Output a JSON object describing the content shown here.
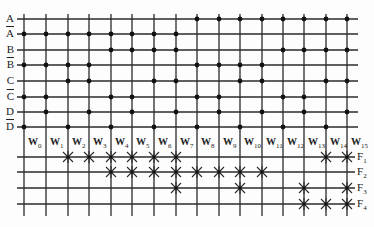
{
  "diagram": {
    "type": "PLA / decoder-based ROM crosspoint array",
    "colors": {
      "line": "#2a2a2a",
      "dot": "#111111",
      "background": "#fdfdfd"
    },
    "inputs": [
      {
        "name": "A",
        "complement": false,
        "y": 19
      },
      {
        "name": "A",
        "complement": true,
        "y": 34
      },
      {
        "name": "B",
        "complement": false,
        "y": 50
      },
      {
        "name": "B",
        "complement": true,
        "y": 65
      },
      {
        "name": "C",
        "complement": false,
        "y": 81
      },
      {
        "name": "C",
        "complement": true,
        "y": 97
      },
      {
        "name": "D",
        "complement": false,
        "y": 112
      },
      {
        "name": "D",
        "complement": true,
        "y": 127
      }
    ],
    "word_lines": [
      {
        "label": "W",
        "sub": "0",
        "x": 24,
        "bits": "0000"
      },
      {
        "label": "W",
        "sub": "1",
        "x": 46,
        "bits": "0001"
      },
      {
        "label": "W",
        "sub": "2",
        "x": 68,
        "bits": "0010"
      },
      {
        "label": "W",
        "sub": "3",
        "x": 89,
        "bits": "0011"
      },
      {
        "label": "W",
        "sub": "4",
        "x": 111,
        "bits": "0100"
      },
      {
        "label": "W",
        "sub": "5",
        "x": 132,
        "bits": "0101"
      },
      {
        "label": "W",
        "sub": "6",
        "x": 154,
        "bits": "0110"
      },
      {
        "label": "W",
        "sub": "7",
        "x": 176,
        "bits": "0111"
      },
      {
        "label": "W",
        "sub": "8",
        "x": 197,
        "bits": "1000"
      },
      {
        "label": "W",
        "sub": "9",
        "x": 219,
        "bits": "1001"
      },
      {
        "label": "W",
        "sub": "10",
        "x": 240,
        "bits": "1010"
      },
      {
        "label": "W",
        "sub": "11",
        "x": 262,
        "bits": "1011"
      },
      {
        "label": "W",
        "sub": "12",
        "x": 283,
        "bits": "1100"
      },
      {
        "label": "W",
        "sub": "13",
        "x": 304,
        "bits": "1101"
      },
      {
        "label": "W",
        "sub": "14",
        "x": 326,
        "bits": "1110"
      },
      {
        "label": "W",
        "sub": "15",
        "x": 347,
        "bits": "1111"
      }
    ],
    "outputs": [
      {
        "label": "F",
        "sub": "1",
        "y": 157,
        "crosses": [
          2,
          3,
          4,
          5,
          6,
          7,
          14,
          15
        ]
      },
      {
        "label": "F",
        "sub": "2",
        "y": 172,
        "crosses": [
          4,
          5,
          6,
          7,
          8,
          9,
          10,
          11
        ]
      },
      {
        "label": "F",
        "sub": "3",
        "y": 188,
        "crosses": [
          7,
          10,
          13,
          15
        ]
      },
      {
        "label": "F",
        "sub": "4",
        "y": 204,
        "crosses": [
          13,
          14,
          15
        ]
      }
    ]
  }
}
